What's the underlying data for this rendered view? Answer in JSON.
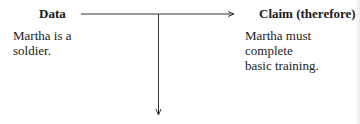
{
  "diagram": {
    "nodes": {
      "data": {
        "label": "Data",
        "text": [
          "Martha is a",
          "soldier."
        ]
      },
      "claim": {
        "label": "Claim (therefore)",
        "text": [
          "Martha must",
          "complete",
          "basic training."
        ]
      }
    },
    "edges": [
      {
        "from": "data",
        "to": "claim",
        "direction": "right"
      },
      {
        "from": "data-claim-line",
        "to": "below",
        "direction": "down"
      }
    ],
    "colors": {
      "text": "#1a1a1a",
      "line": "#333333",
      "background": "#ffffff"
    }
  }
}
